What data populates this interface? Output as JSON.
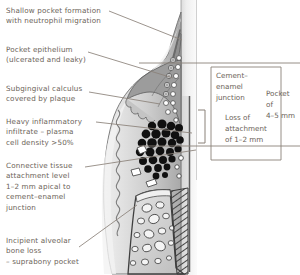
{
  "figure": {
    "background_color": "#ffffff",
    "text_color": "#6b6358",
    "leader_line_color": "#8a8178"
  },
  "labels_left": [
    {
      "id": "shallow-pocket",
      "text": "Shallow pocket formation\nwith neutrophil migration"
    },
    {
      "id": "pocket-epithelium",
      "text": "Pocket epithelium\n(ulcerated and leaky)"
    },
    {
      "id": "subgingival-calculus",
      "text": "Subgingival calculus\ncovered by plaque"
    },
    {
      "id": "inflammatory-infiltrate",
      "text": "Heavy inflammatory\ninfiltrate – plasma\ncell density >50%"
    },
    {
      "id": "connective-tissue-attachment",
      "text": "Connective tissue\nattachment level\n1–2 mm apical to\ncement–enamel\njunction"
    },
    {
      "id": "alveolar-bone-loss",
      "text": "Incipient alveolar\nbone loss\n– suprabony pocket"
    }
  ],
  "labels_right": [
    {
      "id": "cement-enamel-junction",
      "text": "Cement–\nenamel\njunction"
    },
    {
      "id": "loss-of-attachment",
      "text": "Loss of\nattachment\nof 1–2 mm"
    },
    {
      "id": "pocket-depth",
      "text": "Pocket\nof\n4–5 mm"
    }
  ],
  "anatomy": {
    "tooth_enamel_color": "#e8e8e8",
    "gingiva_color": "#c9c9c9",
    "gingiva_shadow_color": "#a8a8a8",
    "calculus_color": "#8c8c8c",
    "infiltrate_cell_color": "#141414",
    "bone_color": "#d6d6d6",
    "pdl_hatch_color": "#4a4a4a",
    "epithelial_cell_color": "#ffffff",
    "outline_color": "#3a3a3a"
  }
}
